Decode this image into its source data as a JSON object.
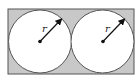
{
  "diagram": {
    "colors": {
      "rect_fill": "#c8c8c8",
      "rect_stroke": "#555555",
      "circle_fill": "#ffffff",
      "line": "#111111"
    },
    "rectangle": {
      "x": 8,
      "y": 9,
      "width": 126,
      "height": 65
    },
    "circles": [
      {
        "cx": 40,
        "cy": 41,
        "r": 31.5,
        "radius_label": "r"
      },
      {
        "cx": 102,
        "cy": 41,
        "r": 31.5,
        "radius_label": "r"
      }
    ]
  }
}
